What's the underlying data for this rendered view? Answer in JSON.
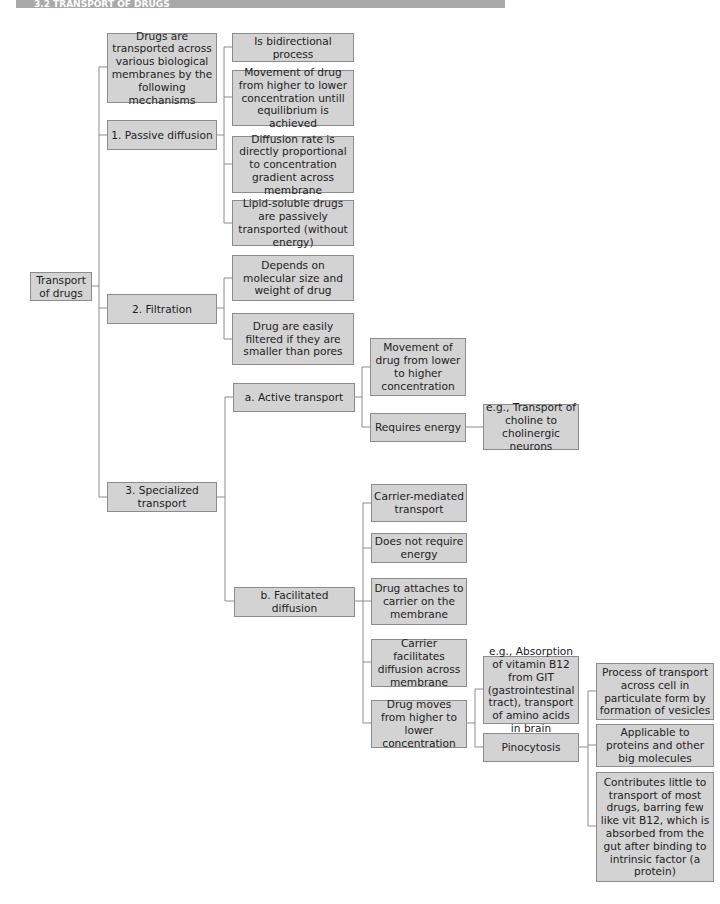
{
  "header": {
    "title": "3.2 TRANSPORT OF DRUGS"
  },
  "nodes": {
    "root": "Transport of drugs",
    "intro": "Drugs are transported across various biological membranes by the following mechanisms",
    "passive": "1. Passive diffusion",
    "passive_1": "Is bidirectional process",
    "passive_2": "Movement of drug from higher to lower concentration untill equilibrium is achieved",
    "passive_3": "Diffusion rate is directly proportional to concentration gradient across membrane",
    "passive_4": "Lipid-soluble drugs are passively transported (without energy)",
    "filtration": "2. Filtration",
    "filtration_1": "Depends on molecular size and weight of drug",
    "filtration_2": "Drug are easily filtered if they are smaller than pores",
    "specialized": "3. Specialized transport",
    "active": "a. Active transport",
    "active_1": "Movement of drug from lower to higher concentration",
    "active_2": "Requires energy",
    "active_2_eg": "e.g., Transport of choline to cholinergic neurons",
    "facilitated": "b. Facilitated diffusion",
    "fac_1": "Carrier-mediated transport",
    "fac_2": "Does not require energy",
    "fac_3": "Drug attaches to carrier on the membrane",
    "fac_4": "Carrier facilitates diffusion across membrane",
    "fac_5": "Drug moves from higher to lower concentration",
    "fac_5_eg": "e.g., Absorption of vitamin B12 from GIT (gastrointestinal tract), transport of amino acids in brain",
    "pinocytosis": "Pinocytosis",
    "pino_1": "Process of transport across cell in particulate form by formation of vesicles",
    "pino_2": "Applicable to proteins and other big molecules",
    "pino_3": "Contributes little to transport of most drugs, barring few like vit B12, which is absorbed from the gut after binding to intrinsic factor (a protein)"
  }
}
